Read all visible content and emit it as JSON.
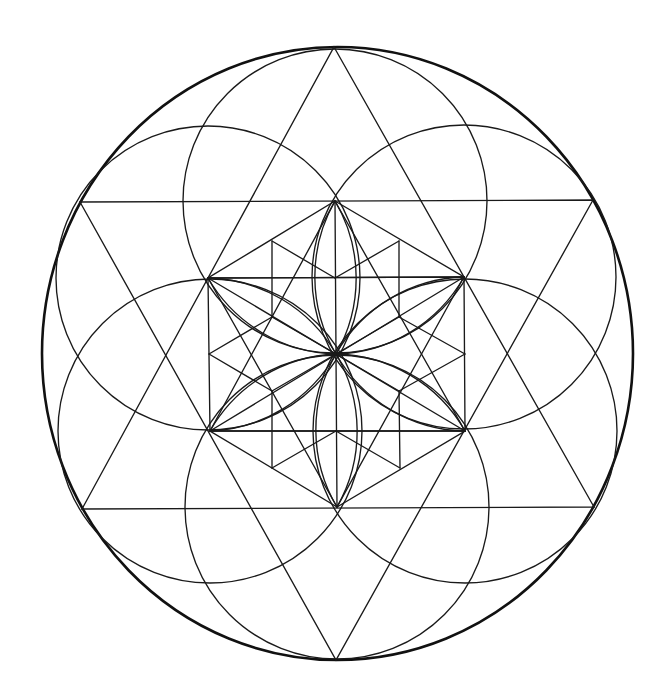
{
  "figure": {
    "title": "Sacred geometry mandala: Star of David with seed-of-life petals and inner cube",
    "background": "#ffffff",
    "stroke_color": "#1a1a1a",
    "outer_stroke_color": "#111111"
  },
  "geometry": {
    "center": [
      336,
      354
    ],
    "outer_ellipse": {
      "cx": 337.5,
      "cy": 353.5,
      "rx": 295.5,
      "ry": 306.5
    },
    "petal_radius": 152,
    "hexagon": {
      "T": [
        335,
        201
      ],
      "UR": [
        464,
        277
      ],
      "LR": [
        465,
        431
      ],
      "B": [
        337,
        507
      ],
      "LL": [
        210,
        431
      ],
      "UL": [
        208,
        278
      ]
    },
    "star_up": [
      [
        334,
        47
      ],
      [
        594,
        507
      ],
      [
        82,
        509
      ]
    ],
    "star_down": [
      [
        80,
        202
      ],
      [
        593,
        200
      ],
      [
        336,
        660
      ]
    ],
    "inner": {
      "a": [
        272,
        241
      ],
      "b": [
        399,
        241
      ],
      "c": [
        272,
        317
      ],
      "d": [
        399,
        317
      ],
      "e": [
        335,
        278
      ],
      "f": [
        209,
        354
      ],
      "g": [
        465,
        354
      ],
      "h": [
        272,
        391
      ],
      "i": [
        399,
        391
      ],
      "j": [
        336,
        431
      ],
      "k": [
        272,
        468
      ],
      "l": [
        400,
        468
      ]
    }
  }
}
